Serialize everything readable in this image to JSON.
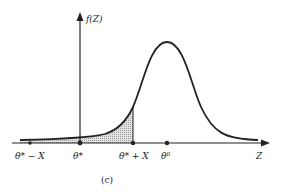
{
  "figure": {
    "caption": "(c)",
    "y_axis_label": "f(Z)",
    "x_axis_label": "Z",
    "points": [
      {
        "label": "θ* − X",
        "x": 30
      },
      {
        "label": "θ*",
        "x": 80
      },
      {
        "label": "θ* + X",
        "x": 133
      },
      {
        "label": "θ⁰",
        "x": 167
      }
    ],
    "shaded_region": "area under curve from left tail to θ* + X",
    "curve": "bell-shaped density centered at θ⁰"
  },
  "colors": {
    "ink": "#222222",
    "shade": "#bbbbbb"
  }
}
